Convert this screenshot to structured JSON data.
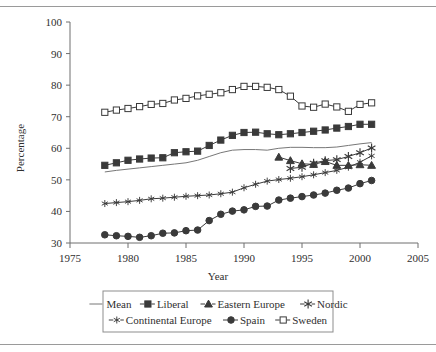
{
  "figure": {
    "kind": "line-chart-figure",
    "rules": {
      "top": true,
      "bottom": true
    }
  },
  "axes": {
    "y_title": "Percentage",
    "x_title": "Year",
    "y_ticks": [
      "30",
      "40",
      "50",
      "60",
      "70",
      "80",
      "90",
      "100"
    ],
    "x_ticks": [
      "1975",
      "1980",
      "1985",
      "1990",
      "1995",
      "2000",
      "2005"
    ]
  },
  "legend": {
    "rows": [
      [
        {
          "label": "Mean",
          "marker": "line"
        },
        {
          "label": "Liberal",
          "marker": "filled-square"
        },
        {
          "label": "Eastern Europe",
          "marker": "filled-triangle"
        },
        {
          "label": "Nordic",
          "marker": "star6"
        }
      ],
      [
        {
          "label": "Continental Europe",
          "marker": "star6-small"
        },
        {
          "label": "Spain",
          "marker": "filled-circle"
        },
        {
          "label": "Sweden",
          "marker": "open-square"
        }
      ]
    ]
  },
  "colors": {
    "ink": "#3a3a3a",
    "mean_line": "#777777",
    "axis": "#6f6f6f",
    "legend_border": "#8d8d8d",
    "page_rule": "#9a9a9a",
    "background": "#ffffff"
  },
  "chart_data": {
    "type": "line",
    "title": "",
    "xlabel": "Year",
    "ylabel": "Percentage",
    "xlim": [
      1975,
      2005
    ],
    "ylim": [
      30,
      100
    ],
    "ytick_step": 10,
    "xtick_step": 5,
    "grid": false,
    "legend_position": "bottom",
    "series": [
      {
        "name": "Mean",
        "marker": "none",
        "x": [
          1978,
          1979,
          1980,
          1981,
          1982,
          1983,
          1984,
          1985,
          1986,
          1987,
          1988,
          1989,
          1990,
          1991,
          1992,
          1993,
          1994,
          1995,
          1996,
          1997,
          1998,
          1999,
          2000,
          2001
        ],
        "values": [
          52.5,
          53.0,
          53.4,
          53.8,
          54.2,
          54.6,
          55.0,
          55.4,
          56.2,
          57.4,
          58.6,
          59.4,
          59.6,
          59.6,
          59.4,
          60.0,
          60.3,
          60.3,
          60.2,
          60.2,
          60.4,
          60.9,
          61.4,
          61.8
        ]
      },
      {
        "name": "Liberal",
        "marker": "filled-square",
        "x": [
          1978,
          1979,
          1980,
          1981,
          1982,
          1983,
          1984,
          1985,
          1986,
          1987,
          1988,
          1989,
          1990,
          1991,
          1992,
          1993,
          1994,
          1995,
          1996,
          1997,
          1998,
          1999,
          2000,
          2001
        ],
        "values": [
          54.6,
          55.4,
          56.2,
          56.6,
          56.9,
          57.0,
          58.6,
          58.9,
          59.1,
          60.9,
          62.6,
          64.1,
          65.0,
          65.1,
          64.6,
          64.3,
          64.6,
          65.0,
          65.4,
          65.8,
          66.4,
          66.9,
          67.6,
          67.6
        ]
      },
      {
        "name": "Eastern Europe",
        "marker": "filled-triangle",
        "x": [
          1993,
          1994,
          1995,
          1996,
          1997,
          1998,
          1999,
          2000,
          2001
        ],
        "values": [
          57.2,
          56.1,
          55.1,
          54.9,
          55.8,
          54.6,
          54.6,
          54.8,
          54.6
        ]
      },
      {
        "name": "Nordic",
        "marker": "star6",
        "x": [
          1994,
          1995,
          1996,
          1997,
          1998,
          1999,
          2000,
          2001
        ],
        "values": [
          53.6,
          54.0,
          55.3,
          56.1,
          56.4,
          57.4,
          58.6,
          60.1
        ]
      },
      {
        "name": "Continental Europe",
        "marker": "star6-small",
        "x": [
          1978,
          1979,
          1980,
          1981,
          1982,
          1983,
          1984,
          1985,
          1986,
          1987,
          1988,
          1989,
          1990,
          1991,
          1992,
          1993,
          1994,
          1995,
          1996,
          1997,
          1998,
          1999,
          2000,
          2001
        ],
        "values": [
          42.5,
          42.8,
          43.1,
          43.5,
          44.0,
          44.2,
          44.5,
          44.8,
          45.0,
          45.2,
          45.6,
          46.1,
          47.5,
          48.6,
          49.6,
          50.1,
          50.5,
          51.0,
          51.6,
          52.3,
          53.0,
          54.0,
          55.6,
          57.6
        ]
      },
      {
        "name": "Spain",
        "marker": "filled-circle",
        "x": [
          1978,
          1979,
          1980,
          1981,
          1982,
          1983,
          1984,
          1985,
          1986,
          1987,
          1988,
          1989,
          1990,
          1991,
          1992,
          1993,
          1994,
          1995,
          1996,
          1997,
          1998,
          1999,
          2000,
          2001
        ],
        "values": [
          32.6,
          32.3,
          32.1,
          31.8,
          32.3,
          33.1,
          33.2,
          33.9,
          34.1,
          37.1,
          39.1,
          40.1,
          40.5,
          41.6,
          41.7,
          43.6,
          44.2,
          44.7,
          45.2,
          45.8,
          46.7,
          47.4,
          48.8,
          49.8
        ]
      },
      {
        "name": "Sweden",
        "marker": "open-square",
        "x": [
          1978,
          1979,
          1980,
          1981,
          1982,
          1983,
          1984,
          1985,
          1986,
          1987,
          1988,
          1989,
          1990,
          1991,
          1992,
          1993,
          1994,
          1995,
          1996,
          1997,
          1998,
          1999,
          2000,
          2001
        ],
        "values": [
          71.4,
          72.1,
          72.6,
          73.2,
          73.9,
          74.2,
          75.3,
          75.8,
          76.6,
          77.1,
          77.6,
          78.6,
          79.6,
          79.6,
          79.3,
          78.6,
          76.5,
          73.4,
          73.0,
          74.0,
          73.1,
          71.7,
          73.9,
          74.4
        ]
      }
    ]
  }
}
